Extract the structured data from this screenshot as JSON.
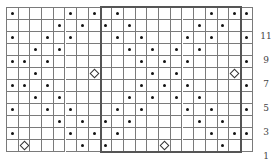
{
  "chart_data": {
    "type": "chart-grid",
    "title": "",
    "columns": 21,
    "rows": 12,
    "row_labels": [
      "1",
      "3",
      "5",
      "7",
      "9",
      "11"
    ],
    "row_label_rows": [
      1,
      3,
      5,
      7,
      9,
      11
    ],
    "highlight_box": {
      "col_start": 9,
      "col_end": 20,
      "row_start": 1,
      "row_end": 12
    },
    "cells": {
      "12": {
        "dots": [
          1,
          6,
          8,
          10,
          18,
          20,
          21
        ],
        "diamonds": []
      },
      "11": {
        "dots": [
          5,
          7,
          9,
          11,
          17,
          19
        ],
        "diamonds": []
      },
      "10": {
        "dots": [
          1,
          4,
          6,
          10,
          12,
          16,
          18,
          21
        ],
        "diamonds": []
      },
      "9": {
        "dots": [
          3,
          5,
          11,
          13,
          15,
          17
        ],
        "diamonds": []
      },
      "8": {
        "dots": [
          1,
          2,
          4,
          12,
          14,
          16,
          21
        ],
        "diamonds": []
      },
      "7": {
        "dots": [
          3,
          13,
          15
        ],
        "diamonds": [
          8,
          20
        ]
      },
      "6": {
        "dots": [
          1,
          2,
          4,
          12,
          14,
          16,
          21
        ],
        "diamonds": []
      },
      "5": {
        "dots": [
          3,
          5,
          11,
          13,
          15,
          17
        ],
        "diamonds": []
      },
      "4": {
        "dots": [
          1,
          4,
          6,
          10,
          12,
          16,
          18,
          21
        ],
        "diamonds": []
      },
      "3": {
        "dots": [
          5,
          7,
          9,
          11,
          17,
          19
        ],
        "diamonds": []
      },
      "2": {
        "dots": [
          1,
          6,
          8,
          10,
          18,
          20,
          21
        ],
        "diamonds": []
      },
      "1": {
        "dots": [
          7,
          9,
          19
        ],
        "diamonds": [
          2,
          14
        ]
      }
    },
    "legend": {
      "dot": "stitch symbol (dot)",
      "diamond": "stitch symbol (diamond)"
    }
  },
  "colors": {
    "grid_line": "#7a7a7a",
    "box_border": "#555555",
    "dot": "#111111"
  }
}
